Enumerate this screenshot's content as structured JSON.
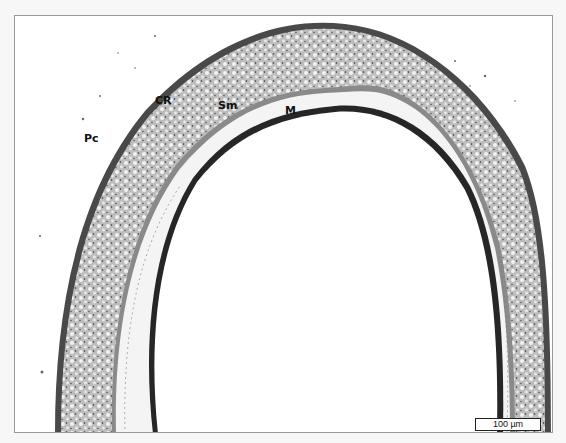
{
  "image": {
    "subject": "histological cross-section of tracheal ring",
    "stain_colors": {
      "cartilage": "#b9b9b9",
      "perichondrium": "#4a4a4a",
      "mucosa": "#2b2b2b",
      "background": "#ffffff",
      "frame": "#9a9a9a"
    }
  },
  "labels": [
    {
      "id": "pc",
      "text": "Pc",
      "x": 83,
      "y": 131
    },
    {
      "id": "cr",
      "text": "CR",
      "x": 154,
      "y": 93
    },
    {
      "id": "sm",
      "text": "Sm",
      "x": 217,
      "y": 98
    },
    {
      "id": "m",
      "text": "M",
      "x": 284,
      "y": 92
    }
  ],
  "scale_bar": {
    "label": "100 µm"
  }
}
